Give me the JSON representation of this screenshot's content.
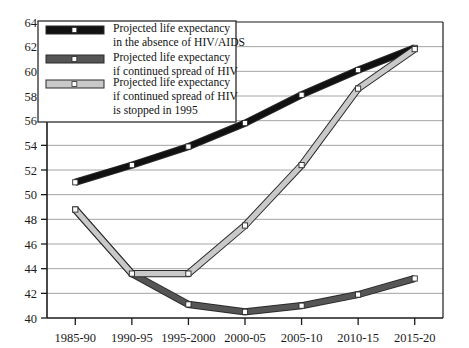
{
  "chart_data": {
    "type": "line",
    "title": "",
    "xlabel": "",
    "ylabel": "",
    "categories": [
      "1985-90",
      "1990-95",
      "1995-2000",
      "2000-05",
      "2005-10",
      "2010-15",
      "2015-20"
    ],
    "ylim": [
      40,
      64
    ],
    "ytick_step": 2,
    "yticks": [
      40,
      42,
      44,
      46,
      48,
      50,
      52,
      54,
      56,
      58,
      60,
      62,
      64
    ],
    "grid": "horizontal",
    "legend_position": "top-left-inside",
    "series": [
      {
        "name": "Projected life expectancy in the absence of HIV/AIDS",
        "color": "#111111",
        "values": [
          51.0,
          52.4,
          53.9,
          55.8,
          58.1,
          60.1,
          61.9
        ]
      },
      {
        "name": "Projected life expectancy if continued spread of HIV",
        "color": "#555555",
        "values": [
          48.8,
          43.6,
          41.1,
          40.5,
          41.0,
          41.9,
          43.2
        ]
      },
      {
        "name": "Projected life expectancy if continued spread of HIV is stopped in 1995",
        "color": "#c9c9c9",
        "values": [
          48.8,
          43.6,
          43.6,
          47.5,
          52.4,
          58.6,
          61.8
        ]
      }
    ]
  },
  "legend": {
    "items": [
      {
        "swatch": "black-thick-line-swatch",
        "line1": "Projected life expectancy",
        "line2": "in the absence of HIV/AIDS",
        "line3": ""
      },
      {
        "swatch": "darkgray-thick-line-swatch",
        "line1": "Projected life expectancy",
        "line2": "if continued spread of HIV",
        "line3": ""
      },
      {
        "swatch": "lightgray-thick-line-swatch",
        "line1": "Projected life expectancy",
        "line2": "if continued spread of HIV",
        "line3": "is stopped in 1995"
      }
    ]
  },
  "axis": {
    "y_labels": [
      "64",
      "62",
      "60",
      "58",
      "56",
      "54",
      "52",
      "50",
      "48",
      "46",
      "44",
      "42",
      "40"
    ],
    "x_labels": [
      "1985-90",
      "1990-95",
      "1995-2000",
      "2000-05",
      "2005-10",
      "2010-15",
      "2015-20"
    ]
  },
  "colors": {
    "series_black": "#111111",
    "series_dark_gray": "#555555",
    "series_light_gray": "#c9c9c9",
    "gridline": "#9a9a9a",
    "axis": "#1b1b1b",
    "background": "#ffffff"
  }
}
